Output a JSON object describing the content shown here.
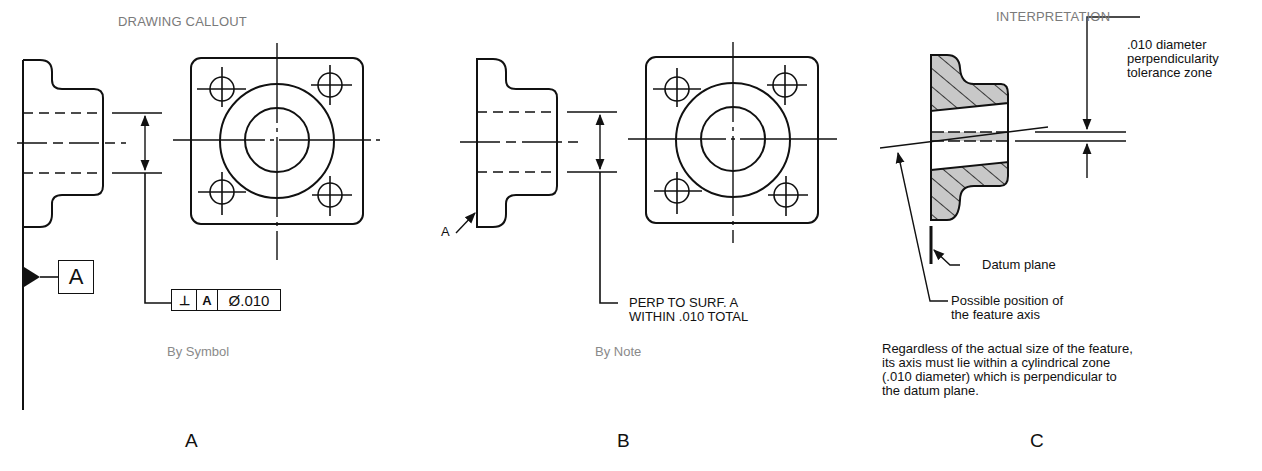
{
  "panels": {
    "a": {
      "header": "DRAWING CALLOUT",
      "caption": "By Symbol",
      "letter": "A",
      "datum_label": "A",
      "feature_control_frame": {
        "symbol": "⊥",
        "datum": "A",
        "tolerance": "Ø.010"
      }
    },
    "b": {
      "caption": "By Note",
      "letter": "B",
      "surface_label": "A",
      "note_line1": "PERP TO SURF. A",
      "note_line2": "WITHIN .010 TOTAL"
    },
    "c": {
      "header": "INTERPRETATION",
      "letter": "C",
      "zone_label_line1": ".010 diameter",
      "zone_label_line2": "perpendicularity",
      "zone_label_line3": "tolerance zone",
      "datum_plane_label": "Datum plane",
      "axis_label_line1": "Possible position of",
      "axis_label_line2": "the feature axis",
      "explanation": "Regardless of the actual size of the feature, its axis must lie within a cylindrical zone (.010 diameter) which is perpendicular to the datum plane."
    }
  },
  "colors": {
    "line": "#111111",
    "caption": "#8a8a8a",
    "hatch_fill": "#c8c8c8"
  }
}
